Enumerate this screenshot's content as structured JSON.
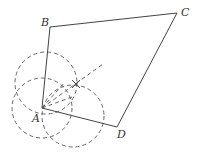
{
  "figure": {
    "type": "geometry-construction",
    "stroke_color": "#444444",
    "dash_color": "#555555",
    "vertices": [
      {
        "name": "A",
        "x": 42,
        "y": 108,
        "label_x": 32,
        "label_y": 122
      },
      {
        "name": "B",
        "x": 50,
        "y": 27,
        "label_x": 41,
        "label_y": 26
      },
      {
        "name": "C",
        "x": 177,
        "y": 13,
        "label_x": 181,
        "label_y": 16
      },
      {
        "name": "D",
        "x": 117,
        "y": 127,
        "label_x": 117,
        "label_y": 138
      }
    ],
    "polygon": "A-B-C-D",
    "construction_circles": [
      {
        "cx": 46,
        "cy": 83,
        "r": 31
      },
      {
        "cx": 42,
        "cy": 108,
        "r": 30
      },
      {
        "cx": 73,
        "cy": 116,
        "r": 31
      }
    ],
    "bisector": {
      "x1": 42,
      "y1": 108,
      "x2": 103,
      "y2": 64
    },
    "intersection_mark": {
      "x": 76,
      "y": 84
    }
  }
}
